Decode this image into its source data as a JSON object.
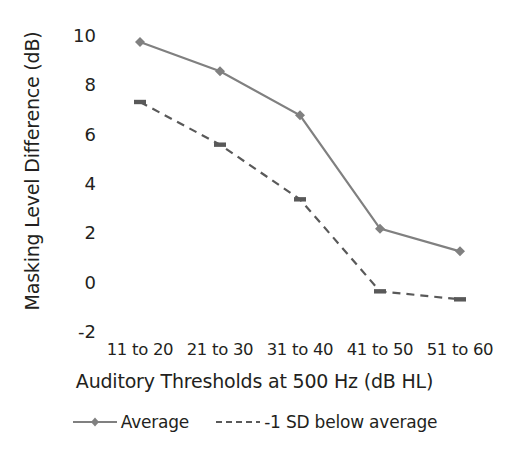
{
  "chart_data": {
    "type": "line",
    "title": "",
    "xlabel": "Auditory Thresholds at 500 Hz (dB HL)",
    "ylabel": "Masking Level Difference (dB)",
    "categories": [
      "11 to 20",
      "21 to 30",
      "31 to 40",
      "41 to 50",
      "51 to 60"
    ],
    "series": [
      {
        "name": "Average",
        "values": [
          9.25,
          8.15,
          6.5,
          2.25,
          1.4
        ],
        "style": "solid",
        "marker": "diamond",
        "color": "#808080"
      },
      {
        "name": "-1 SD below average",
        "values": [
          7.0,
          5.4,
          3.35,
          -0.1,
          -0.4
        ],
        "style": "dashed",
        "marker": "dash",
        "color": "#595959"
      }
    ],
    "ylim": [
      -2,
      10
    ],
    "yticks": [
      10,
      8,
      6,
      4,
      2,
      0,
      -2
    ],
    "ytick_labels": [
      "10",
      "8",
      "6",
      "4",
      "2",
      "0",
      "-2"
    ],
    "grid": false,
    "legend_position": "bottom"
  },
  "axis": {
    "y_title": "Masking Level Difference (dB)",
    "x_title": "Auditory Thresholds at 500 Hz (dB HL)",
    "y_tick_labels": [
      "10",
      "8",
      "6",
      "4",
      "2",
      "0",
      "-2"
    ],
    "x_tick_labels": [
      "11 to 20",
      "21 to 30",
      "31 to 40",
      "41 to 50",
      "51 to 60"
    ]
  },
  "legend": {
    "items": [
      {
        "label": "Average"
      },
      {
        "label": "-1 SD below average"
      }
    ]
  },
  "colors": {
    "series_average": "#808080",
    "series_sd": "#595959",
    "text": "#231f20",
    "background": "#ffffff"
  }
}
